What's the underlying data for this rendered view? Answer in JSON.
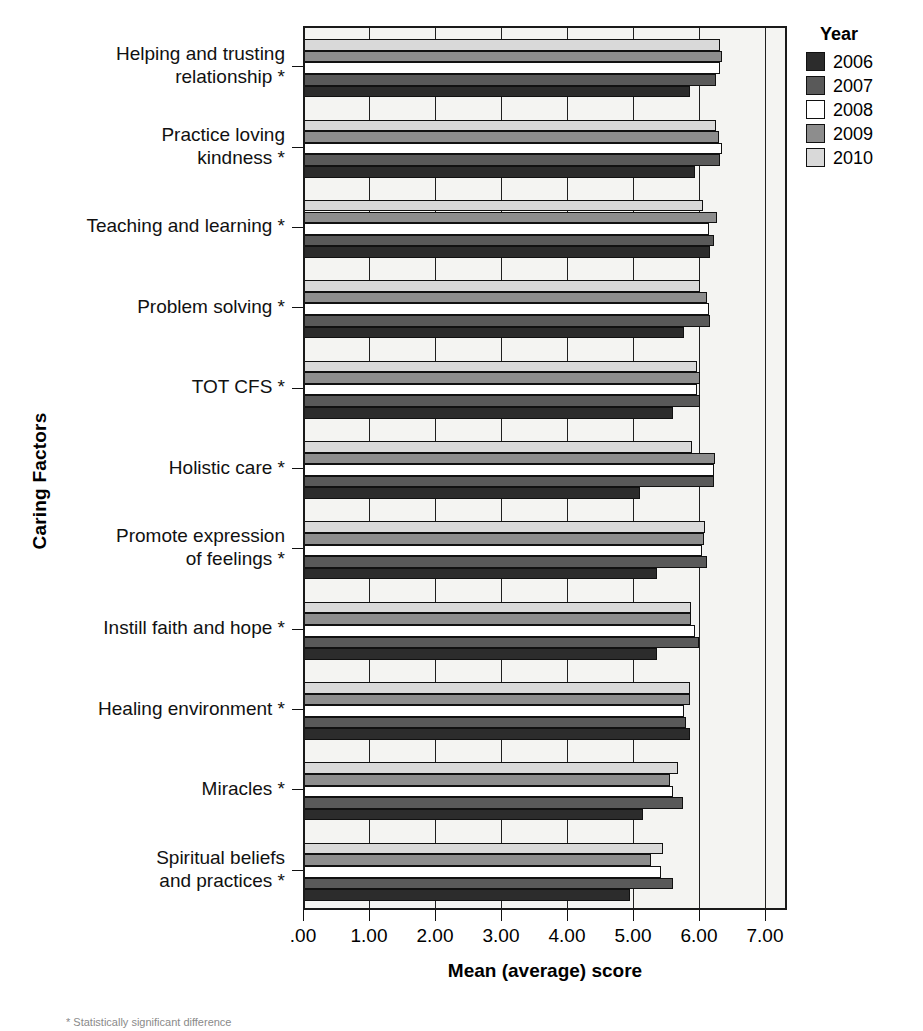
{
  "chart_data": {
    "type": "bar",
    "orientation": "horizontal",
    "title": "",
    "xlabel": "Mean (average) score",
    "ylabel": "Caring Factors",
    "xlim": [
      0,
      7
    ],
    "xticks": [
      0,
      1,
      2,
      3,
      4,
      5,
      6,
      7
    ],
    "xtick_labels": [
      ".00",
      "1.00",
      "2.00",
      "3.00",
      "4.00",
      "5.00",
      "6.00",
      "7.00"
    ],
    "grid": true,
    "legend_title": "Year",
    "legend_position": "right",
    "categories": [
      "Helping and trusting\nrelationship *",
      "Practice loving\nkindness *",
      "Teaching and learning *",
      "Problem solving *",
      "TOT CFS *",
      "Holistic care *",
      "Promote expression\nof feelings *",
      "Instill faith and hope *",
      "Healing environment *",
      "Miracles *",
      "Spiritual beliefs\nand practices *"
    ],
    "series": [
      {
        "name": "2006",
        "color": "#2c2c2c",
        "values": [
          5.86,
          5.94,
          6.16,
          5.77,
          5.61,
          5.1,
          5.36,
          5.36,
          5.86,
          5.15,
          4.96
        ]
      },
      {
        "name": "2007",
        "color": "#595959",
        "values": [
          6.26,
          6.32,
          6.22,
          6.17,
          6.02,
          6.22,
          6.12,
          6.0,
          5.8,
          5.75,
          5.6
        ]
      },
      {
        "name": "2008",
        "color": "#ffffff",
        "values": [
          6.32,
          6.35,
          6.15,
          6.15,
          5.97,
          6.22,
          6.05,
          5.94,
          5.77,
          5.6,
          5.42
        ]
      },
      {
        "name": "2009",
        "color": "#8d8d8d",
        "values": [
          6.35,
          6.3,
          6.27,
          6.12,
          6.02,
          6.24,
          6.08,
          5.88,
          5.86,
          5.56,
          5.27
        ]
      },
      {
        "name": "2010",
        "color": "#d9d9d9",
        "values": [
          6.32,
          6.25,
          6.06,
          6.02,
          5.97,
          5.89,
          6.09,
          5.88,
          5.86,
          5.68,
          5.45
        ]
      }
    ]
  },
  "legend": {
    "title": "Year",
    "items": [
      {
        "label": "2006",
        "color": "#2c2c2c"
      },
      {
        "label": "2007",
        "color": "#595959"
      },
      {
        "label": "2008",
        "color": "#ffffff"
      },
      {
        "label": "2009",
        "color": "#8d8d8d"
      },
      {
        "label": "2010",
        "color": "#d9d9d9"
      }
    ]
  },
  "axes": {
    "x_title": "Mean (average) score",
    "y_title": "Caring Factors"
  },
  "footnote": {
    "text": "* Statistically significant difference"
  }
}
